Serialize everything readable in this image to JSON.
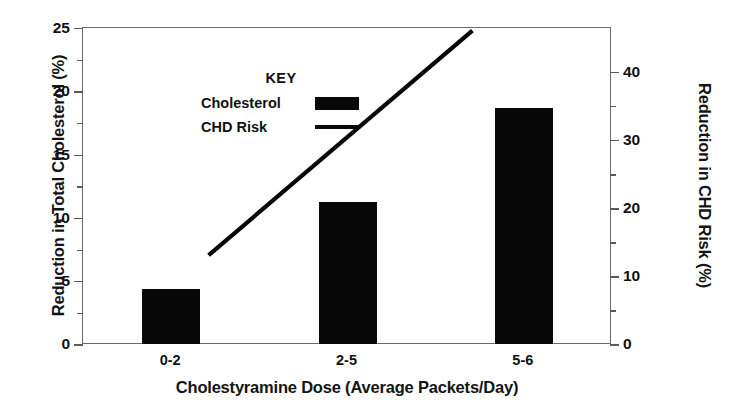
{
  "chart_data": {
    "type": "bar",
    "title": "",
    "subtitle": "",
    "xlabel": "Cholestyramine Dose (Average Packets/Day)",
    "ylabel": "Reduction in Total Cholesterol (%)",
    "y2label": "Reduction in CHD Risk (%)",
    "categories": [
      "0-2",
      "2-5",
      "5-6"
    ],
    "ylim": [
      0,
      25
    ],
    "y2lim": [
      0,
      40
    ],
    "yticks": [
      0,
      5,
      10,
      15,
      20,
      25
    ],
    "yticks_minor": [
      2.5,
      7.5,
      12.5,
      17.5,
      22.5
    ],
    "y2ticks": [
      0,
      10,
      20,
      30,
      40
    ],
    "y2ticks_minor": [
      5,
      15,
      25,
      35
    ],
    "ytick_labels": [
      "0",
      "5",
      "10",
      "15",
      "20",
      "25"
    ],
    "y2tick_labels": [
      "0",
      "10",
      "20",
      "30",
      "40"
    ],
    "grid": false,
    "legend_position": "upper-left-inside",
    "series": [
      {
        "name": "Cholesterol",
        "type": "bar",
        "axis": "left",
        "color": "#080808",
        "values": [
          4.4,
          11.3,
          18.7
        ]
      },
      {
        "name": "CHD Risk",
        "type": "line",
        "axis": "right",
        "color": "#080808",
        "values": [
          11.5,
          25.5,
          39.5
        ]
      }
    ]
  },
  "legend": {
    "title": "KEY",
    "entries": [
      {
        "label": "Cholesterol",
        "marker": "filled-rect-swatch"
      },
      {
        "label": "CHD Risk",
        "marker": "solid-line-swatch"
      }
    ]
  },
  "colors": {
    "bar": "#080808",
    "line": "#080808",
    "axis": "#6b6b6b",
    "text": "#111111",
    "background": "#ffffff"
  }
}
